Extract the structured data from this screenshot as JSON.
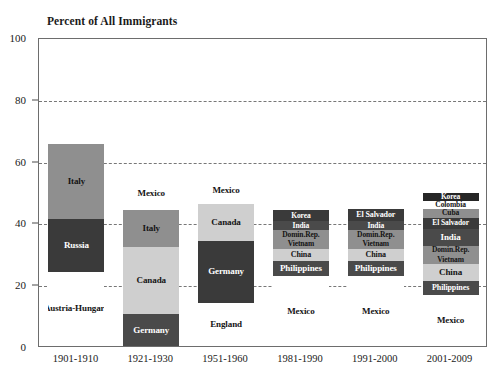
{
  "chart_data": {
    "type": "bar",
    "subtype": "stacked-bar",
    "title": "Percent of All Immigrants",
    "xlabel": "",
    "ylabel": "Percent of All Immigrants",
    "ylim": [
      0,
      100
    ],
    "yticks": [
      0,
      20,
      40,
      60,
      80,
      100
    ],
    "ytick_labels": [
      "0",
      "20",
      "40",
      "60",
      "80",
      "100"
    ],
    "grid": "horizontal-dashed",
    "legend": "none (in-bar labels)",
    "categories": [
      "1901-1910",
      "1921-1930",
      "1951-1960",
      "1981-1990",
      "1991-2000",
      "2001-2009"
    ],
    "note": "Each bar is a stack of leading source countries; segment height = percent of all immigrants for that decade.",
    "bars": [
      {
        "period": "1901-1910",
        "total": 65.5,
        "segments": [
          {
            "label": "Austria-Hungary",
            "value": 24.0,
            "fill": "f-white"
          },
          {
            "label": "Russia",
            "value": 17.0,
            "fill": "f-vdark"
          },
          {
            "label": "Italy",
            "value": 24.5,
            "fill": "f-mid"
          }
        ]
      },
      {
        "period": "1921-1930",
        "total": 54.5,
        "segments": [
          {
            "label": "Germany",
            "value": 10.3,
            "fill": "f-dark"
          },
          {
            "label": "Canada",
            "value": 21.7,
            "fill": "f-light"
          },
          {
            "label": "Italy",
            "value": 12.0,
            "fill": "f-mid"
          },
          {
            "label": "Mexico",
            "value": 10.5,
            "fill": "f-white"
          }
        ]
      },
      {
        "period": "1951-1960",
        "total": 54.5,
        "segments": [
          {
            "label": "England",
            "value": 14.0,
            "fill": "f-white"
          },
          {
            "label": "Germany",
            "value": 20.0,
            "fill": "f-vdark"
          },
          {
            "label": "Canada",
            "value": 12.0,
            "fill": "f-light"
          },
          {
            "label": "Mexico",
            "value": 8.5,
            "fill": "f-white"
          }
        ]
      },
      {
        "period": "1981-1990",
        "total": 47.5,
        "segments": [
          {
            "label": "Mexico",
            "value": 22.5,
            "fill": "f-white"
          },
          {
            "label": "Philippines",
            "value": 5.0,
            "fill": "f-dark"
          },
          {
            "label": "China",
            "value": 4.0,
            "fill": "f-light"
          },
          {
            "label": "Vietnam",
            "value": 3.0,
            "fill": "f-mid"
          },
          {
            "label": "Domin.Rep.",
            "value": 3.0,
            "fill": "f-mid"
          },
          {
            "label": "India",
            "value": 3.0,
            "fill": "f-dark"
          },
          {
            "label": "Korea",
            "value": 3.5,
            "fill": "f-vdark"
          }
        ]
      },
      {
        "period": "1991-2000",
        "total": 47.5,
        "segments": [
          {
            "label": "Mexico",
            "value": 22.5,
            "fill": "f-white"
          },
          {
            "label": "Philippines",
            "value": 5.0,
            "fill": "f-dark"
          },
          {
            "label": "China",
            "value": 4.0,
            "fill": "f-light"
          },
          {
            "label": "Vietnam",
            "value": 3.0,
            "fill": "f-mid"
          },
          {
            "label": "Domin.Rep.",
            "value": 3.0,
            "fill": "f-mid"
          },
          {
            "label": "India",
            "value": 3.0,
            "fill": "f-dark"
          },
          {
            "label": "El Salvador",
            "value": 4.0,
            "fill": "f-vdark"
          }
        ]
      },
      {
        "period": "2001-2009",
        "total": 53.0,
        "segments": [
          {
            "label": "Mexico",
            "value": 16.5,
            "fill": "f-white"
          },
          {
            "label": "Philippines",
            "value": 4.5,
            "fill": "f-dark"
          },
          {
            "label": "China",
            "value": 5.5,
            "fill": "f-light"
          },
          {
            "label": "Vietnam",
            "value": 3.0,
            "fill": "f-mid"
          },
          {
            "label": "Domin.Rep.",
            "value": 3.0,
            "fill": "f-mid"
          },
          {
            "label": "India",
            "value": 5.5,
            "fill": "f-dark"
          },
          {
            "label": "El Salvador",
            "value": 3.5,
            "fill": "f-vdark"
          },
          {
            "label": "Cuba",
            "value": 3.0,
            "fill": "f-mid"
          },
          {
            "label": "Colombia",
            "value": 2.5,
            "fill": "f-white"
          },
          {
            "label": "Korea",
            "value": 2.5,
            "fill": "f-black"
          }
        ]
      }
    ]
  }
}
